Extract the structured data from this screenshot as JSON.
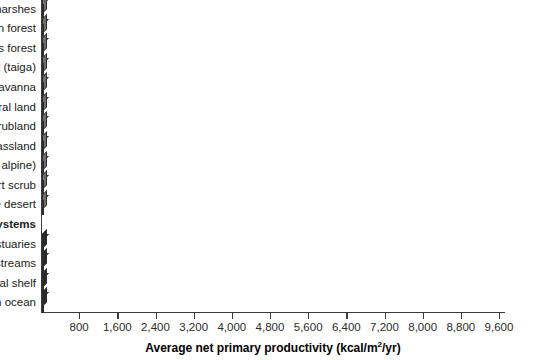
{
  "chart_data": {
    "type": "bar",
    "orientation": "horizontal",
    "title": "",
    "xlabel": "Average net primary productivity (kcal/m2/yr)",
    "xlabel_prefix": "Average net primary productivity (kcal/m",
    "xlabel_sup": "2",
    "xlabel_suffix": "/yr)",
    "ylabel": "",
    "xlim": [
      0,
      9600
    ],
    "xticks": [
      800,
      1600,
      2400,
      3200,
      4000,
      4800,
      5600,
      6400,
      7200,
      8000,
      8800,
      9600
    ],
    "xticklabels": [
      "800",
      "1,600",
      "2,400",
      "3,200",
      "4,000",
      "4,800",
      "5,600",
      "6,400",
      "7,200",
      "8,000",
      "8,800",
      "9,600"
    ],
    "grid": false,
    "legend": "none",
    "series": [
      {
        "name": "Terrestrial ecosystems",
        "color": "#8b8b8b",
        "categories": [
          "Swamps and marshes",
          "Tropical rain forest",
          "Temperate deciduous forest",
          "Northern coniferous forest (taiga)",
          "Savanna",
          "Agricultural land",
          "Woodland and shrubland",
          "Temperate grassland",
          "Tundra (arctic and alpine)",
          "Desert scrub",
          "Extreme desert"
        ],
        "values": [
          8300,
          8300,
          5400,
          3200,
          2700,
          2600,
          2400,
          2400,
          1900,
          420,
          200
        ]
      },
      {
        "name": "Marine Ecosystems",
        "color": "#3a3a3a",
        "is_group_header": true,
        "categories": [
          "Estuaries",
          "Lakes and streams",
          "Continental shelf",
          "Open ocean"
        ],
        "values": [
          8200,
          1950,
          1450,
          1050
        ]
      }
    ],
    "rows": [
      {
        "label": "Swamps and marshes",
        "value": 8300,
        "group": "terrestrial",
        "header": false
      },
      {
        "label": "Tropical rain forest",
        "value": 8300,
        "group": "terrestrial",
        "header": false
      },
      {
        "label": "Temperate deciduous forest",
        "value": 5400,
        "group": "terrestrial",
        "header": false
      },
      {
        "label": "Northern coniferous forest (taiga)",
        "value": 3200,
        "group": "terrestrial",
        "header": false
      },
      {
        "label": "Savanna",
        "value": 2700,
        "group": "terrestrial",
        "header": false
      },
      {
        "label": "Agricultural land",
        "value": 2600,
        "group": "terrestrial",
        "header": false
      },
      {
        "label": "Woodland and shrubland",
        "value": 2400,
        "group": "terrestrial",
        "header": false
      },
      {
        "label": "Temperate grassland",
        "value": 2380,
        "group": "terrestrial",
        "header": false
      },
      {
        "label": "Tundra (arctic and alpine)",
        "value": 1900,
        "group": "terrestrial",
        "header": false
      },
      {
        "label": "Desert scrub",
        "value": 420,
        "group": "terrestrial",
        "header": false
      },
      {
        "label": "Extreme desert",
        "value": 200,
        "group": "terrestrial",
        "header": false
      },
      {
        "label": "Marine Ecosystems",
        "value": 0,
        "group": "header",
        "header": true
      },
      {
        "label": "Estuaries",
        "value": 8200,
        "group": "marine",
        "header": false
      },
      {
        "label": "Lakes and streams",
        "value": 1950,
        "group": "marine",
        "header": false
      },
      {
        "label": "Continental shelf",
        "value": 1450,
        "group": "marine",
        "header": false
      },
      {
        "label": "Open ocean",
        "value": 1050,
        "group": "marine",
        "header": false
      }
    ]
  },
  "colors": {
    "terrestrial_bar": "#8b8b8b",
    "marine_bar": "#3a3a3a",
    "axis": "#3c3c3c",
    "text": "#1b1b1b",
    "background": "#ffffff"
  }
}
